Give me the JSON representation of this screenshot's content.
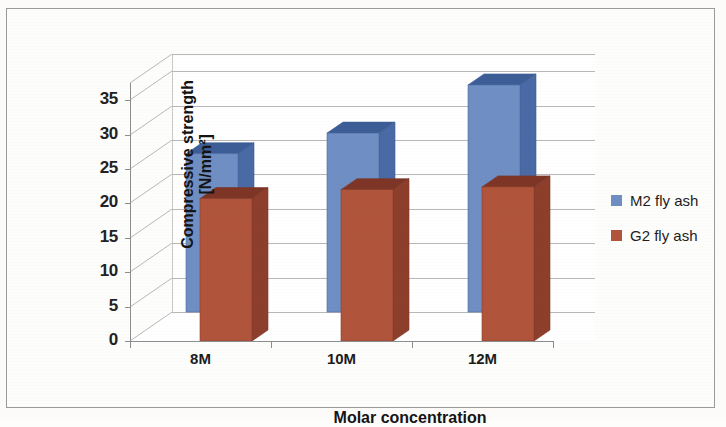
{
  "chart_data": {
    "type": "bar",
    "title": "",
    "subtitle": "",
    "xlabel": "Molar concentration",
    "ylabel": "Compressive strength [N/mm²]",
    "ylabel_line1": "Compressive strength",
    "ylabel_line2": "[N/mm²]",
    "categories": [
      "8M",
      "10M",
      "12M"
    ],
    "series": [
      {
        "name": "M2 fly ash",
        "color": "#6f8fc4",
        "values": [
          23.0,
          26.0,
          33.0
        ]
      },
      {
        "name": "G2 fly ash",
        "color": "#b0553b",
        "values": [
          20.7,
          22.0,
          22.4
        ]
      }
    ],
    "yticks": [
      0,
      5,
      10,
      15,
      20,
      25,
      30,
      35
    ],
    "ytick_labels": [
      "0",
      "5",
      "10",
      "15",
      "20",
      "25",
      "30",
      "35"
    ],
    "ylim": [
      0,
      37.5
    ],
    "grid": true,
    "grid_axis": "y",
    "legend_position": "right",
    "style": "3d-clustered-column",
    "annotations": []
  },
  "legend": {
    "items": [
      {
        "label": "M2 fly ash",
        "color": "#6f8fc4"
      },
      {
        "label": "G2 fly ash",
        "color": "#b0553b"
      }
    ]
  },
  "colors": {
    "series_blue": "#6f8fc4",
    "series_blue_top": "#3c5d96",
    "series_blue_side": "#4a6aa6",
    "series_red": "#b0553b",
    "series_red_top": "#7e3526",
    "series_red_side": "#8d3f2c",
    "gridline": "#b8b8b8",
    "axis": "#8d8d8d",
    "frame": "#9a9a96",
    "background": "#fdfdfc",
    "text": "#141414"
  }
}
